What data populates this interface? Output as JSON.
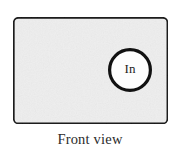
{
  "figure": {
    "caption": "Front view",
    "panel": {
      "name": "front-panel",
      "fill_color": "#eeeeee",
      "stroke_color": "#1a1a1a",
      "x": 13,
      "y": 17,
      "width": 155,
      "height": 107,
      "corner_radius": 4,
      "stroke_width": 1.6
    },
    "port": {
      "label": "In",
      "name": "inlet-port",
      "fill_color": "#fdfdfd",
      "stroke_color": "#111111",
      "center_x": 130,
      "center_y": 70,
      "radius": 20.5,
      "stroke_width": 3.2
    },
    "background_color": "#ffffff",
    "caption_color": "#2b2b2b"
  }
}
